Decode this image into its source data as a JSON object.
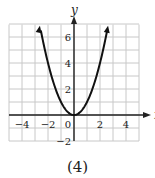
{
  "chart_data": {
    "type": "line",
    "title": "",
    "caption": "(4)",
    "xlabel": "x",
    "ylabel": "y",
    "xlim": [
      -5,
      5
    ],
    "ylim": [
      -3,
      7
    ],
    "grid": true,
    "x_ticks": [
      -4,
      -2,
      0,
      2,
      4
    ],
    "y_ticks": [
      -2,
      2,
      4,
      6
    ],
    "x_tick_labels": [
      "−4",
      "−2",
      "0",
      "2",
      "4"
    ],
    "y_tick_labels": [
      "−2",
      "2",
      "4",
      "6"
    ],
    "series": [
      {
        "name": "y = x^2",
        "equation": "y = x^2",
        "x": [
          -2.6,
          -2,
          -1.5,
          -1,
          -0.5,
          0,
          0.5,
          1,
          1.5,
          2,
          2.6
        ],
        "y": [
          6.76,
          4,
          2.25,
          1,
          0.25,
          0,
          0.25,
          1,
          2.25,
          4,
          6.76
        ],
        "arrows_at_ends": true
      }
    ]
  },
  "colors": {
    "grid": "#c8c8c8",
    "axis": "#222222",
    "curve": "#111111",
    "text": "#222222"
  }
}
